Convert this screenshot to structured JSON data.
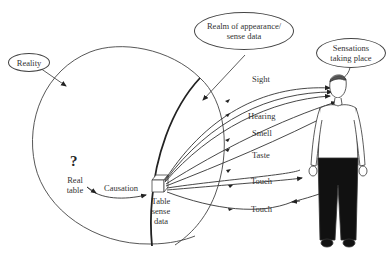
{
  "diagram": {
    "callouts": {
      "reality": "Reality",
      "realm_line1": "Realm of appearance/",
      "realm_line2": "sense data",
      "sensations_line1": "Sensations",
      "sensations_line2": "taking place"
    },
    "real_table": {
      "question_mark": "?",
      "line1": "Real",
      "line2": "table"
    },
    "causation_label": "Causation",
    "sense_data_label": {
      "line1": "Table",
      "line2": "sense",
      "line3": "data"
    },
    "senses": [
      {
        "label": "Sight"
      },
      {
        "label": "Hearing"
      },
      {
        "label": "Smell"
      },
      {
        "label": "Taste"
      },
      {
        "label": "Touch"
      },
      {
        "label": "Touch"
      }
    ],
    "colors": {
      "line": "#333333",
      "pants": "#111111",
      "background": "#ffffff"
    }
  }
}
